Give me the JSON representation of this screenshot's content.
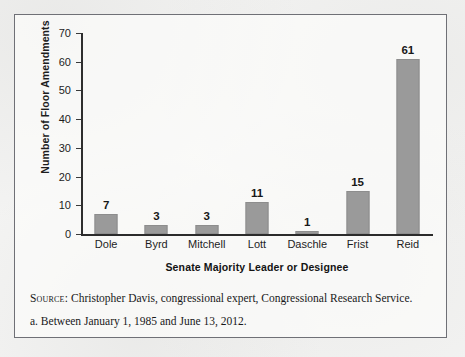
{
  "figure": {
    "notes": {
      "source_label": "Source:",
      "source_text": " Christopher Davis, congressional expert, Congressional Research Service.",
      "footnote_a": "a. Between January 1, 1985 and June 13, 2012."
    }
  },
  "chart_data": {
    "type": "bar",
    "title": "",
    "xlabel": "Senate Majority Leader or Designee",
    "ylabel": "Number of Floor Amendments",
    "categories": [
      "Dole",
      "Byrd",
      "Mitchell",
      "Lott",
      "Daschle",
      "Frist",
      "Reid"
    ],
    "values": [
      7,
      3,
      3,
      11,
      1,
      15,
      61
    ],
    "value_labels": [
      "7",
      "3",
      "3",
      "11",
      "1",
      "15",
      "61"
    ],
    "ylim": [
      0,
      70
    ],
    "yticks": [
      0,
      10,
      20,
      30,
      40,
      50,
      60,
      70
    ],
    "ytick_labels": [
      "0",
      "10",
      "20",
      "30",
      "40",
      "50",
      "60",
      "70"
    ],
    "grid": false,
    "legend": "none",
    "bar_color": "#9a9a9a",
    "axis_color": "#2b2b2b"
  }
}
